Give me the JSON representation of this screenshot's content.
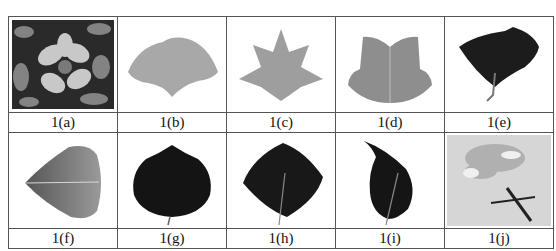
{
  "figure": {
    "rows": [
      {
        "cells": [
          {
            "id": "a",
            "label": "1(a)",
            "subject": "flower photo (grayscale, dark foliage background)",
            "tone": "#5a5a5a"
          },
          {
            "id": "b",
            "label": "1(b)",
            "subject": "ginkgo-shaped fan leaf, light gray",
            "tone": "#a8a8a8"
          },
          {
            "id": "c",
            "label": "1(c)",
            "subject": "maple-like lobed leaf, light gray",
            "tone": "#9e9e9e"
          },
          {
            "id": "d",
            "label": "1(d)",
            "subject": "tulip-tree leaf, mid gray",
            "tone": "#8e8e8e"
          },
          {
            "id": "e",
            "label": "1(e)",
            "subject": "dark fan-shaped leaf with stem",
            "tone": "#1c1c1c"
          }
        ]
      },
      {
        "cells": [
          {
            "id": "f",
            "label": "1(f)",
            "subject": "poplar-shaped leaf, gradient gray, sideways",
            "tone": "#6e6e6e"
          },
          {
            "id": "g",
            "label": "1(g)",
            "subject": "round dark leaf",
            "tone": "#141414"
          },
          {
            "id": "h",
            "label": "1(h)",
            "subject": "ovate dark leaf",
            "tone": "#181818"
          },
          {
            "id": "i",
            "label": "1(i)",
            "subject": "pointed-tip dark leaf",
            "tone": "#151515"
          },
          {
            "id": "j",
            "label": "1(j)",
            "subject": "carnation flower photo on light background",
            "tone": "#cfcfcf"
          }
        ]
      }
    ]
  }
}
